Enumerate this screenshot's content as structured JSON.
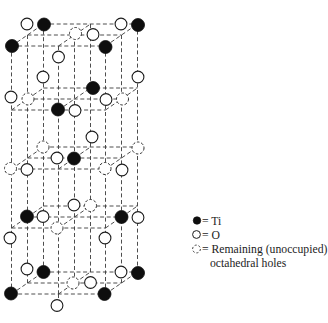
{
  "diagram": {
    "grid": {
      "origin_x": 11.5,
      "step_x": 47,
      "depth_dx": 16,
      "depth_dy": -11,
      "plane_front_y": [
        46,
        110,
        169,
        228,
        294
      ],
      "extra_segments": [
        [
          58.5,
          294,
          58.5,
          299.5
        ]
      ]
    },
    "atom_radius": {
      "Ti": 6.5,
      "O": 5.9,
      "hole": 6
    },
    "atoms": [
      {
        "type": "O",
        "x": 27,
        "y": 24
      },
      {
        "type": "Ti",
        "x": 44,
        "y": 24.5
      },
      {
        "type": "O",
        "x": 121,
        "y": 24
      },
      {
        "type": "Ti",
        "x": 138,
        "y": 25
      },
      {
        "type": "hole",
        "x": 75.5,
        "y": 33.5
      },
      {
        "type": "O",
        "x": 93,
        "y": 34.5
      },
      {
        "type": "Ti",
        "x": 12,
        "y": 46
      },
      {
        "type": "Ti",
        "x": 105.5,
        "y": 47
      },
      {
        "type": "O",
        "x": 58.5,
        "y": 57
      },
      {
        "type": "O",
        "x": 43,
        "y": 77
      },
      {
        "type": "O",
        "x": 138,
        "y": 77
      },
      {
        "type": "Ti",
        "x": 93,
        "y": 88
      },
      {
        "type": "O",
        "x": 11,
        "y": 97
      },
      {
        "type": "hole",
        "x": 28,
        "y": 99
      },
      {
        "type": "O",
        "x": 106,
        "y": 99.5
      },
      {
        "type": "hole",
        "x": 122.5,
        "y": 99
      },
      {
        "type": "Ti",
        "x": 58,
        "y": 109.5
      },
      {
        "type": "O",
        "x": 75,
        "y": 110.5
      },
      {
        "type": "O",
        "x": 92,
        "y": 137
      },
      {
        "type": "hole",
        "x": 43,
        "y": 147
      },
      {
        "type": "hole",
        "x": 138,
        "y": 148
      },
      {
        "type": "O",
        "x": 57,
        "y": 158
      },
      {
        "type": "Ti",
        "x": 74,
        "y": 158.5
      },
      {
        "type": "hole",
        "x": 10.5,
        "y": 168.5
      },
      {
        "type": "O",
        "x": 27,
        "y": 169.5
      },
      {
        "type": "hole",
        "x": 105,
        "y": 168.5
      },
      {
        "type": "O",
        "x": 122,
        "y": 170
      },
      {
        "type": "O",
        "x": 74,
        "y": 205
      },
      {
        "type": "hole",
        "x": 90.5,
        "y": 205.5
      },
      {
        "type": "Ti",
        "x": 27,
        "y": 216.5
      },
      {
        "type": "O",
        "x": 43,
        "y": 216.5
      },
      {
        "type": "Ti",
        "x": 121.5,
        "y": 217
      },
      {
        "type": "O",
        "x": 138,
        "y": 217.5
      },
      {
        "type": "hole",
        "x": 57,
        "y": 228
      },
      {
        "type": "O",
        "x": 10,
        "y": 238
      },
      {
        "type": "O",
        "x": 105,
        "y": 238
      },
      {
        "type": "O",
        "x": 27,
        "y": 269
      },
      {
        "type": "Ti",
        "x": 43.5,
        "y": 272
      },
      {
        "type": "O",
        "x": 121,
        "y": 272
      },
      {
        "type": "Ti",
        "x": 138,
        "y": 273
      },
      {
        "type": "hole",
        "x": 73,
        "y": 283
      },
      {
        "type": "O",
        "x": 90.5,
        "y": 282.5
      },
      {
        "type": "Ti",
        "x": 11,
        "y": 293.5
      },
      {
        "type": "Ti",
        "x": 104.5,
        "y": 294
      },
      {
        "type": "O",
        "x": 57,
        "y": 305.5
      }
    ]
  },
  "legend": {
    "items": [
      {
        "symbol": "filled-circle",
        "species": "Ti",
        "label": "= Ti"
      },
      {
        "symbol": "open-circle",
        "species": "O",
        "label": "= O"
      },
      {
        "symbol": "dashed-circle",
        "species": "hole",
        "label": "= Remaining (unoccupied)",
        "label_line2": "octahedral holes"
      }
    ]
  }
}
